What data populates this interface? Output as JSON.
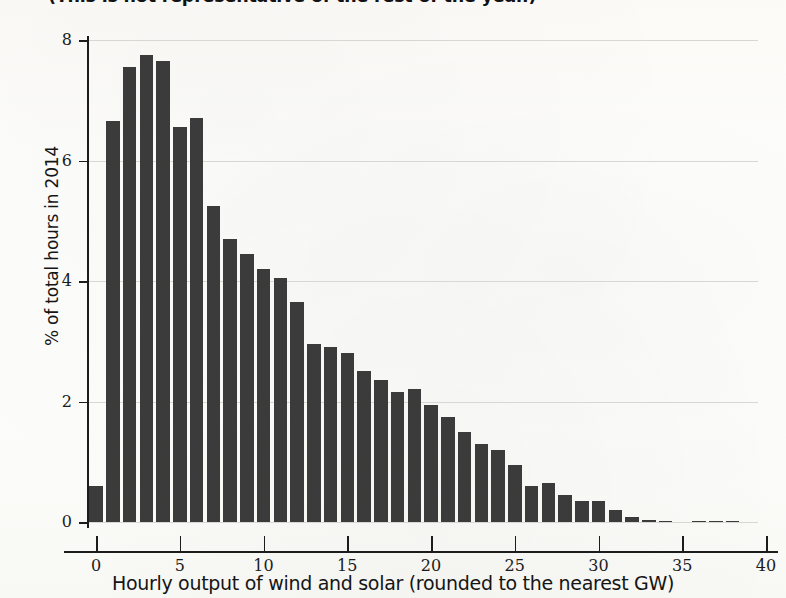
{
  "title": "(This is not representative of the rest of the year.)",
  "colors": {
    "bar": "#3b3b3b",
    "axis": "#1c1c1c",
    "grid": "#d8d8d2",
    "background": "#fdfdfb"
  },
  "chart_data": {
    "type": "bar",
    "title": "(This is not representative of the rest of the year.)",
    "xlabel": "Hourly output of wind and solar (rounded to the nearest GW)",
    "ylabel": "% of total hours in 2014",
    "xlim": [
      -1,
      40
    ],
    "ylim": [
      0,
      8
    ],
    "xticks": [
      0,
      5,
      10,
      15,
      20,
      25,
      30,
      35,
      40
    ],
    "yticks": [
      0,
      2,
      4,
      6,
      8
    ],
    "grid": true,
    "legend": "none",
    "categories": [
      0,
      1,
      2,
      3,
      4,
      5,
      6,
      7,
      8,
      9,
      10,
      11,
      12,
      13,
      14,
      15,
      16,
      17,
      18,
      19,
      20,
      21,
      22,
      23,
      24,
      25,
      26,
      27,
      28,
      29,
      30,
      31,
      32,
      33,
      34,
      35,
      36,
      37,
      38
    ],
    "values": [
      0.6,
      6.65,
      7.55,
      7.75,
      7.65,
      6.55,
      6.7,
      5.25,
      4.7,
      4.45,
      4.2,
      4.05,
      3.65,
      2.95,
      2.9,
      2.8,
      2.5,
      2.35,
      2.15,
      2.2,
      1.95,
      1.75,
      1.5,
      1.3,
      1.2,
      0.95,
      0.6,
      0.65,
      0.45,
      0.35,
      0.35,
      0.2,
      0.08,
      0.04,
      0.02,
      0.0,
      0.02,
      0.02,
      0.01
    ]
  },
  "y_axis": {
    "title": "% of total hours in 2014",
    "ticks": [
      "8",
      "6",
      "4",
      "2",
      "0"
    ]
  },
  "x_axis": {
    "title": "Hourly output of wind and solar (rounded to the nearest GW)",
    "ticks": [
      "0",
      "5",
      "10",
      "15",
      "20",
      "25",
      "30",
      "35",
      "40"
    ]
  }
}
